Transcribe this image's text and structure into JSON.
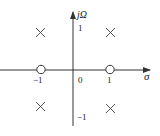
{
  "diagram": {
    "type": "pole-zero plot",
    "axes": {
      "horizontal_label": "σ",
      "vertical_label": "jΩ",
      "origin_label": "0"
    },
    "ticks": {
      "x_neg": "−1",
      "x_pos": "1",
      "y_pos": "1",
      "y_neg": "−1"
    },
    "zeros": [
      {
        "sigma": -1,
        "omega": 0
      },
      {
        "sigma": 1,
        "omega": 0
      }
    ],
    "poles": [
      {
        "sigma": -1,
        "omega": 1
      },
      {
        "sigma": 1,
        "omega": 1
      },
      {
        "sigma": -1,
        "omega": -1
      },
      {
        "sigma": 1,
        "omega": -1
      }
    ],
    "colors": {
      "line": "#333333",
      "background": "#ffffff"
    }
  }
}
